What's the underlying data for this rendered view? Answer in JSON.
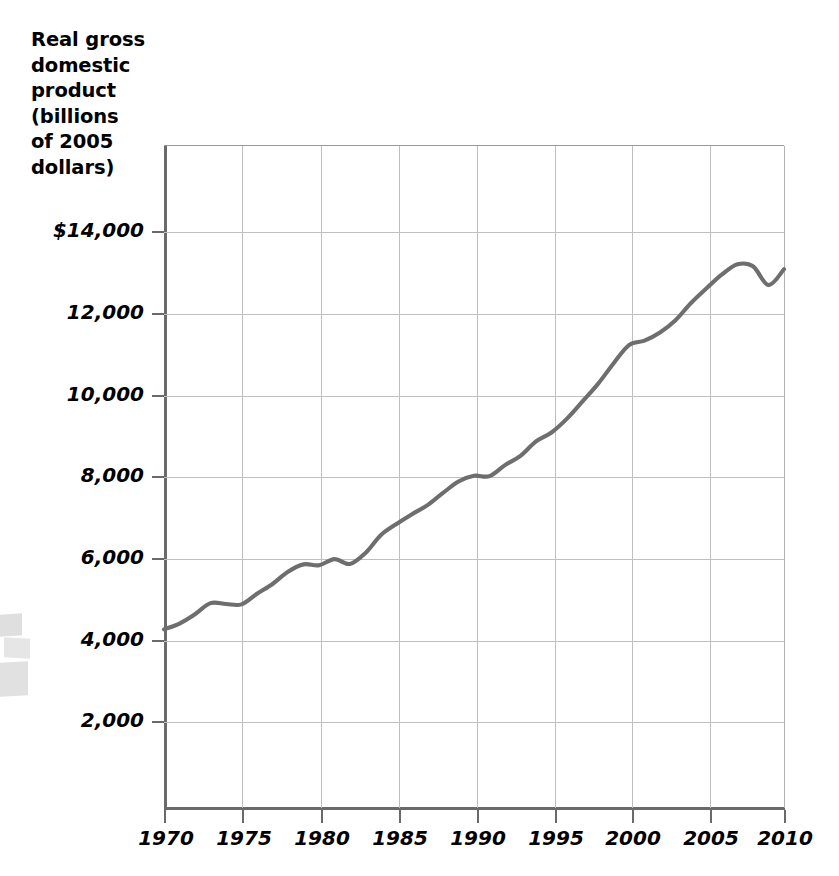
{
  "chart_data": {
    "type": "line",
    "title": "",
    "xlabel": "",
    "ylabel": "Real gross\ndomestic\nproduct\n(billions\nof 2005\ndollars)",
    "ylabel_plain": "Real gross domestic product (billions of 2005 dollars)",
    "xlim": [
      1970,
      2010
    ],
    "ylim": [
      0,
      15000
    ],
    "grid": true,
    "legend": "none",
    "y_ticks": [
      {
        "value": 14000,
        "label": "$14,000"
      },
      {
        "value": 12000,
        "label": "12,000"
      },
      {
        "value": 10000,
        "label": "10,000"
      },
      {
        "value": 8000,
        "label": "8,000"
      },
      {
        "value": 6000,
        "label": "6,000"
      },
      {
        "value": 4000,
        "label": "4,000"
      },
      {
        "value": 2000,
        "label": "2,000"
      }
    ],
    "x_ticks": [
      {
        "value": 1970,
        "label": "1970"
      },
      {
        "value": 1975,
        "label": "1975"
      },
      {
        "value": 1980,
        "label": "1980"
      },
      {
        "value": 1985,
        "label": "1985"
      },
      {
        "value": 1990,
        "label": "1990"
      },
      {
        "value": 1995,
        "label": "1995"
      },
      {
        "value": 2000,
        "label": "2000"
      },
      {
        "value": 2005,
        "label": "2005"
      },
      {
        "value": 2010,
        "label": "2010"
      }
    ],
    "series": [
      {
        "name": "Real GDP",
        "color": "#6e6e6e",
        "x": [
          1970,
          1971,
          1972,
          1973,
          1974,
          1975,
          1976,
          1977,
          1978,
          1979,
          1980,
          1981,
          1982,
          1983,
          1984,
          1985,
          1986,
          1987,
          1988,
          1989,
          1990,
          1991,
          1992,
          1993,
          1994,
          1995,
          1996,
          1997,
          1998,
          1999,
          2000,
          2001,
          2002,
          2003,
          2004,
          2005,
          2006,
          2007,
          2008,
          2009,
          2010
        ],
        "values": [
          4270,
          4410,
          4640,
          4910,
          4890,
          4880,
          5140,
          5380,
          5680,
          5860,
          5840,
          5990,
          5870,
          6140,
          6580,
          6850,
          7090,
          7310,
          7610,
          7890,
          8030,
          8020,
          8290,
          8520,
          8870,
          9090,
          9430,
          9850,
          10280,
          10780,
          11230,
          11340,
          11540,
          11840,
          12260,
          12620,
          12960,
          13210,
          13160,
          12700,
          13090
        ]
      }
    ],
    "annotations": []
  }
}
